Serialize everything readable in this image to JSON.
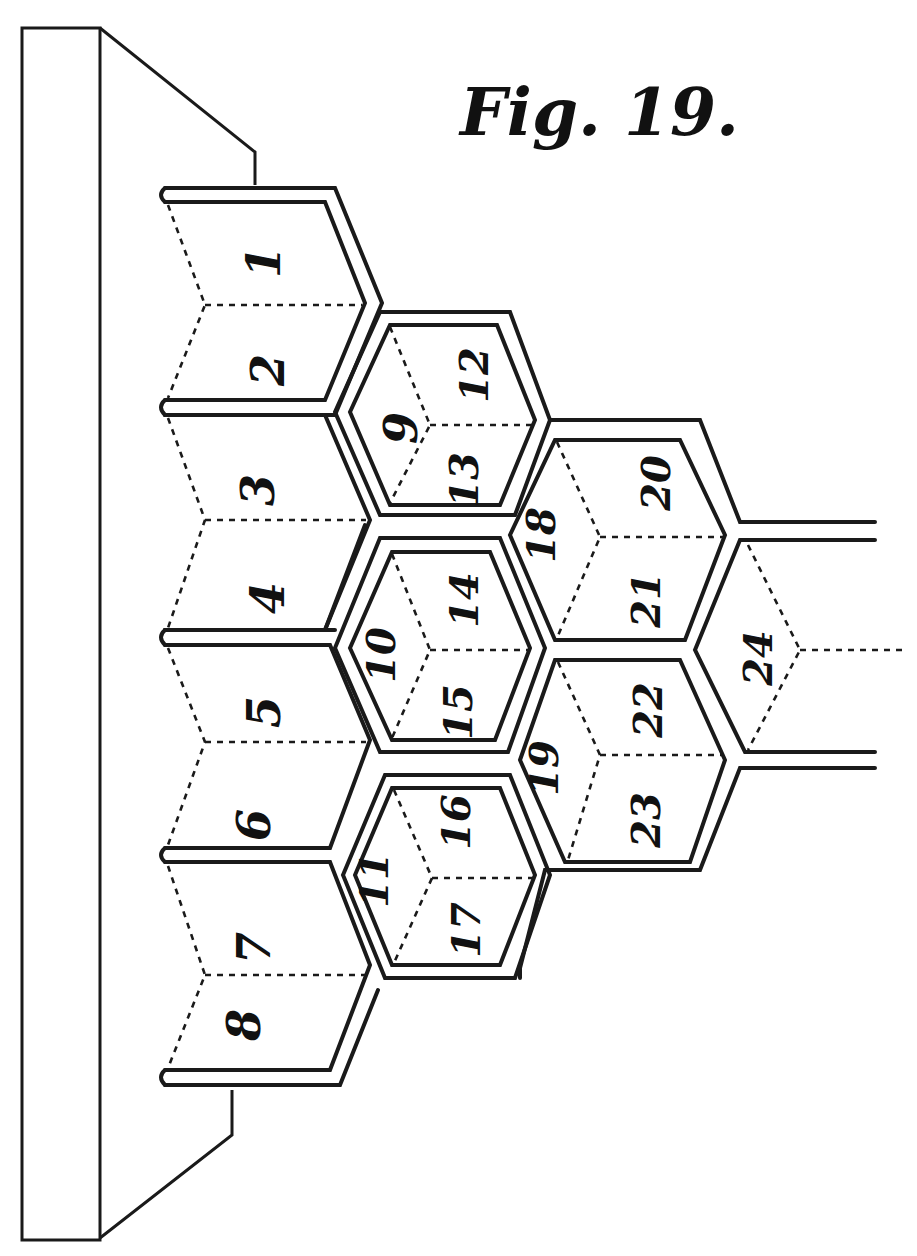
{
  "figure": {
    "title": "Fig. 19.",
    "colors": {
      "ink": "#1a1a1a",
      "paper": "#ffffff"
    },
    "cells": [
      {
        "label": "1",
        "x": 268,
        "y": 262,
        "rot": -90
      },
      {
        "label": "2",
        "x": 272,
        "y": 370,
        "rot": -90
      },
      {
        "label": "3",
        "x": 262,
        "y": 490,
        "rot": -90
      },
      {
        "label": "4",
        "x": 272,
        "y": 598,
        "rot": -90
      },
      {
        "label": "5",
        "x": 268,
        "y": 712,
        "rot": -90
      },
      {
        "label": "6",
        "x": 258,
        "y": 825,
        "rot": -90
      },
      {
        "label": "7",
        "x": 258,
        "y": 948,
        "rot": -90
      },
      {
        "label": "8",
        "x": 248,
        "y": 1025,
        "rot": -90
      },
      {
        "label": "9",
        "x": 405,
        "y": 428,
        "rot": -90
      },
      {
        "label": "10",
        "x": 385,
        "y": 655,
        "rot": -90
      },
      {
        "label": "11",
        "x": 378,
        "y": 880,
        "rot": -90
      },
      {
        "label": "12",
        "x": 478,
        "y": 375,
        "rot": -90
      },
      {
        "label": "13",
        "x": 468,
        "y": 480,
        "rot": -90
      },
      {
        "label": "14",
        "x": 468,
        "y": 600,
        "rot": -90
      },
      {
        "label": "15",
        "x": 462,
        "y": 712,
        "rot": -90
      },
      {
        "label": "16",
        "x": 460,
        "y": 822,
        "rot": -90
      },
      {
        "label": "17",
        "x": 470,
        "y": 930,
        "rot": -90
      },
      {
        "label": "18",
        "x": 545,
        "y": 535,
        "rot": -90
      },
      {
        "label": "19",
        "x": 548,
        "y": 768,
        "rot": -90
      },
      {
        "label": "20",
        "x": 660,
        "y": 483,
        "rot": -90
      },
      {
        "label": "21",
        "x": 650,
        "y": 600,
        "rot": -90
      },
      {
        "label": "22",
        "x": 652,
        "y": 710,
        "rot": -90
      },
      {
        "label": "23",
        "x": 650,
        "y": 820,
        "rot": -90
      },
      {
        "label": "24",
        "x": 762,
        "y": 658,
        "rot": -90
      }
    ]
  }
}
